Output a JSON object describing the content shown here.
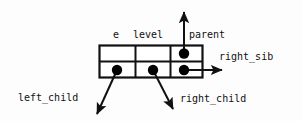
{
  "diagram": {
    "type": "struct-layout-diagram",
    "colors": {
      "background": "#fdfdfd",
      "stroke": "#111111",
      "dot_fill": "#000000",
      "text": "#111111"
    },
    "struct_box": {
      "rows": 2,
      "columns": 3,
      "cells": [
        {
          "row": 0,
          "col": 0,
          "has_pointer_dot": false
        },
        {
          "row": 0,
          "col": 1,
          "has_pointer_dot": false
        },
        {
          "row": 0,
          "col": 2,
          "has_pointer_dot": true
        },
        {
          "row": 1,
          "col": 0,
          "has_pointer_dot": true
        },
        {
          "row": 1,
          "col": 1,
          "has_pointer_dot": true
        },
        {
          "row": 1,
          "col": 2,
          "has_pointer_dot": true
        }
      ]
    },
    "field_labels": [
      {
        "id": "e",
        "text": "e"
      },
      {
        "id": "level",
        "text": "level"
      },
      {
        "id": "parent",
        "text": "parent"
      }
    ],
    "pointer_labels": [
      {
        "id": "right_sib",
        "text": "right_sib",
        "direction": "right"
      },
      {
        "id": "left_child",
        "text": "left_child",
        "direction": "down-left"
      },
      {
        "id": "right_child",
        "text": "right_child",
        "direction": "down-right"
      },
      {
        "id": "parent_arrow",
        "text": "parent",
        "direction": "up"
      }
    ]
  }
}
